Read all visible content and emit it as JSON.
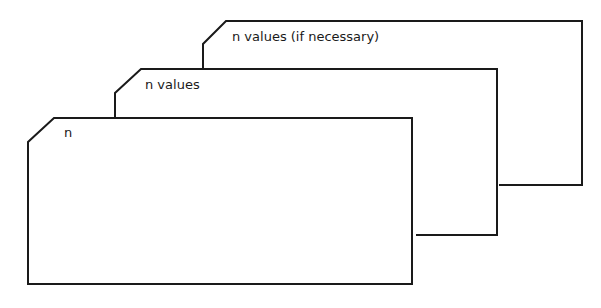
{
  "diagram": {
    "type": "stacked-cards",
    "cards": [
      {
        "id": "back",
        "label": "n values (if necessary)"
      },
      {
        "id": "middle",
        "label": "n values"
      },
      {
        "id": "front",
        "label": "n"
      }
    ],
    "colors": {
      "line": "#1a1a1a",
      "background": "#ffffff"
    }
  }
}
